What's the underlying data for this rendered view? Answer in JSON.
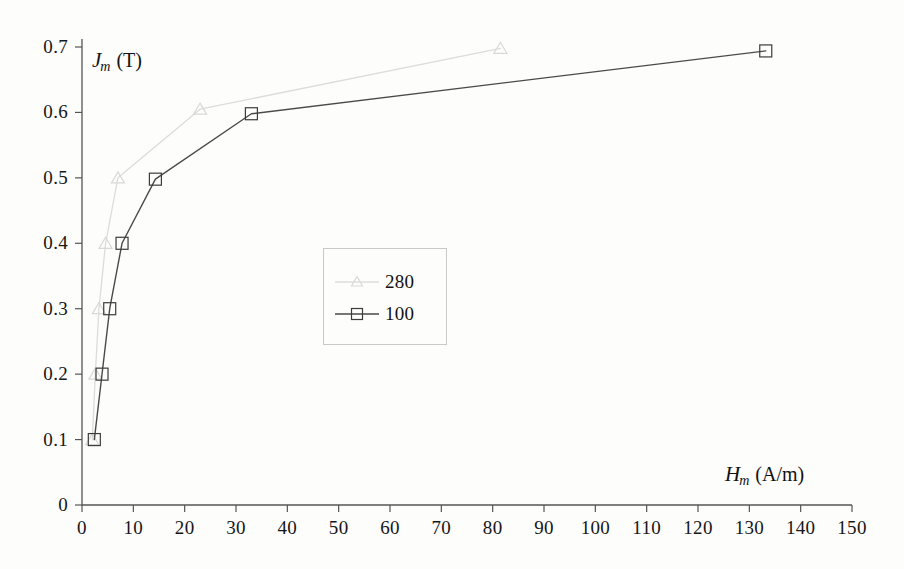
{
  "chart_data": {
    "type": "line",
    "title": "",
    "xlabel": "H_m (A/m)",
    "ylabel": "J_m (T)",
    "xlabel_symbol": "H",
    "xlabel_sub": "m",
    "xlabel_unit": "(A/m)",
    "ylabel_symbol": "J",
    "ylabel_sub": "m",
    "ylabel_unit": "(T)",
    "xlim": [
      0,
      150
    ],
    "ylim": [
      0,
      0.7
    ],
    "xticks": [
      0,
      10,
      20,
      30,
      40,
      50,
      60,
      70,
      80,
      90,
      100,
      110,
      120,
      130,
      140,
      150
    ],
    "yticks": [
      0,
      0.1,
      0.2,
      0.3,
      0.4,
      0.5,
      0.6,
      0.7
    ],
    "xtick_labels": [
      "0",
      "10",
      "20",
      "30",
      "40",
      "50",
      "60",
      "70",
      "80",
      "90",
      "100",
      "110",
      "120",
      "130",
      "140",
      "150"
    ],
    "ytick_labels": [
      "0",
      "0.1",
      "0.2",
      "0.3",
      "0.4",
      "0.5",
      "0.6",
      "0.7"
    ],
    "grid": false,
    "legend_position": "center",
    "series": [
      {
        "name": "280",
        "marker": "triangle",
        "color": "#dcdcdc",
        "x": [
          2.0,
          2.6,
          3.3,
          4.6,
          7.0,
          23.0,
          81.5
        ],
        "y": [
          0.1,
          0.2,
          0.3,
          0.4,
          0.5,
          0.605,
          0.698
        ]
      },
      {
        "name": "100",
        "marker": "square",
        "color": "#4a4a4a",
        "x": [
          2.4,
          3.9,
          5.4,
          7.8,
          14.3,
          33.0,
          133.2
        ],
        "y": [
          0.1,
          0.2,
          0.3,
          0.4,
          0.498,
          0.598,
          0.694
        ]
      }
    ]
  },
  "legend": {
    "entries": [
      {
        "label": "280"
      },
      {
        "label": "100"
      }
    ]
  }
}
